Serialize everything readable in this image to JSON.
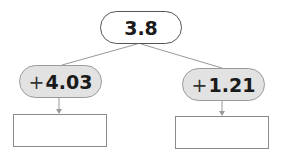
{
  "diagram": {
    "root": {
      "value": "3.8"
    },
    "branches": [
      {
        "sign": "+",
        "operand": "4.03",
        "answer": ""
      },
      {
        "sign": "+",
        "operand": "1.21",
        "answer": ""
      }
    ]
  },
  "colors": {
    "operation_fill": "#e2e2e2",
    "line": "#888888",
    "text": "#1a1a1a"
  }
}
